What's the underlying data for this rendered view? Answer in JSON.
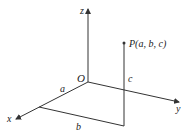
{
  "diagram": {
    "type": "3d-coordinate-point",
    "axes": {
      "x_label": "x",
      "y_label": "y",
      "z_label": "z"
    },
    "origin_label": "O",
    "point_label": "P(a, b, c)",
    "segment_labels": {
      "a": "a",
      "b": "b",
      "c": "c"
    },
    "colors": {
      "lines": "#333333",
      "text": "#222222",
      "background": "#ffffff"
    }
  }
}
